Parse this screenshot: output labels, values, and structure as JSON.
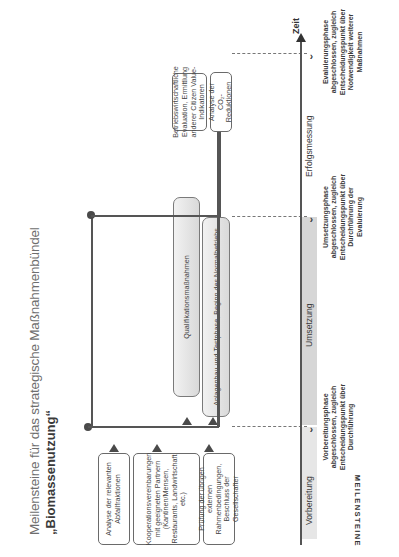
{
  "header": {
    "top_label": "Meilensteine"
  },
  "title": {
    "line1": "Meilensteine für das strategische Maßnahmenbündel",
    "line2": "„Biomassenutzung“"
  },
  "preparation_boxes": [
    {
      "label": "Analyse der relevanten Abfallfraktionen"
    },
    {
      "label": "Kooperationsvereinbarungen mit geeigneten Partnern (Kantinen/Mensen, Restaurants, Landwirtschaft etc.)"
    },
    {
      "label": "Prüfung der übrigen externen Rahmenbedingungen, Beschluss der Gesellschafter"
    }
  ],
  "implementation_boxes": [
    {
      "label": "Qualifikationsmaßnahmen"
    },
    {
      "label": "Anlagenbau und Testphase, Beginn des Normalbetriebs"
    }
  ],
  "evaluation_boxes": [
    {
      "label": "Betriebswirtschaftliche Evaluation, Ermittlung anderer Citizen Value-Indikatoren"
    },
    {
      "label": "Analyse der CO₂-Reduktionen"
    }
  ],
  "timeline": {
    "axis_label": "Zeit",
    "side_label": "MEILENSTEINE",
    "phases": [
      {
        "label": "Vorbereitung"
      },
      {
        "label": "Umsetzung"
      },
      {
        "label": "Erfolgsmessung"
      }
    ],
    "milestones": [
      {
        "label": "Vorbereitungsphase abgeschlossen, zugleich Entscheidungspunkt über Durchführung"
      },
      {
        "label": "Umsetzungsphase abgeschlossen, zugleich Entscheidungspunkt über Durchführung der Evaluierung"
      },
      {
        "label": "Evaluierungsphase abgeschlossen, zugleich Entscheidungspunkt über Notwendigkeit weiterer Maßnahmen"
      }
    ]
  },
  "colors": {
    "line": "#555555",
    "phase_band": "#d6d6d6",
    "box_border": "#6a6a6a",
    "pill_fill": "#e4e4e4"
  }
}
